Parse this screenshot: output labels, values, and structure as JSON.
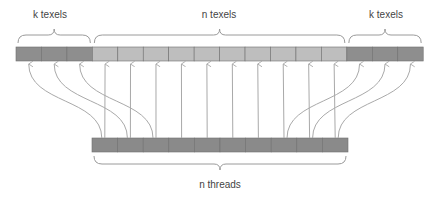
{
  "labels": {
    "left_halo": "k texels",
    "center": "n texels",
    "right_halo": "k texels",
    "threads": "n threads"
  },
  "layout": {
    "texel_row": {
      "x": 16,
      "y": 47,
      "cell_w": 25.45,
      "h": 14,
      "k": 3,
      "n": 10
    },
    "thread_row": {
      "x": 92,
      "y": 138,
      "cell_w": 25.6,
      "h": 14,
      "count": 10
    }
  },
  "colors": {
    "halo_cell": "#8e8e8e",
    "center_cell": "#bebebe",
    "thread_cell": "#8a8a8a",
    "cell_border": "#6f6f6f",
    "arrow": "#a9a9a9",
    "brace": "#9a9a9a",
    "text": "#444444"
  }
}
